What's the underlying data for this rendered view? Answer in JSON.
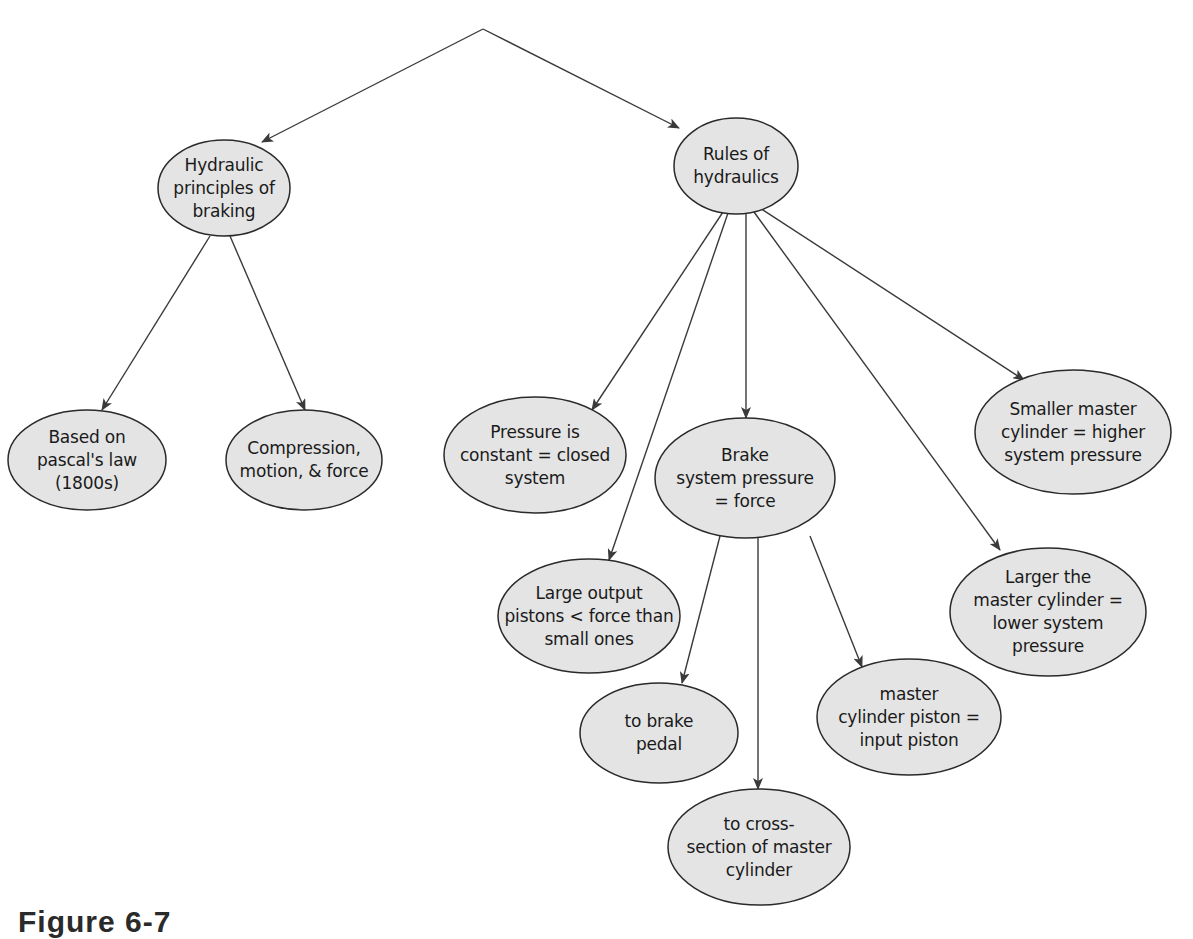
{
  "diagram": {
    "type": "concept-map",
    "colors": {
      "node_fill": "#e4e4e4",
      "node_stroke": "#2a2a2a",
      "edge": "#3a3a3a",
      "background": "#ffffff"
    },
    "root_apex": {
      "x": 483,
      "y": 29
    },
    "nodes": [
      {
        "id": "hydraulic-principles",
        "label": "Hydraulic\nprinciples of\nbraking",
        "cx": 224,
        "cy": 188,
        "rx": 66,
        "ry": 48
      },
      {
        "id": "rules-of-hydraulics",
        "label": "Rules of\nhydraulics",
        "cx": 736,
        "cy": 166,
        "rx": 62,
        "ry": 48
      },
      {
        "id": "pascals-law",
        "label": "Based on\npascal's law\n(1800s)",
        "cx": 87,
        "cy": 460,
        "rx": 79,
        "ry": 50
      },
      {
        "id": "compression-motion-force",
        "label": "Compression,\nmotion, & force",
        "cx": 304,
        "cy": 460,
        "rx": 78,
        "ry": 50
      },
      {
        "id": "pressure-constant",
        "label": "Pressure is\nconstant = closed\nsystem",
        "cx": 535,
        "cy": 455,
        "rx": 91,
        "ry": 58
      },
      {
        "id": "brake-system-pressure",
        "label": "Brake\nsystem pressure\n= force",
        "cx": 745,
        "cy": 478,
        "rx": 90,
        "ry": 60
      },
      {
        "id": "smaller-master-cylinder",
        "label": "Smaller master\ncylinder = higher\nsystem pressure",
        "cx": 1073,
        "cy": 432,
        "rx": 98,
        "ry": 62
      },
      {
        "id": "larger-master-cylinder",
        "label": "Larger the\nmaster cylinder =\nlower system\npressure",
        "cx": 1048,
        "cy": 612,
        "rx": 98,
        "ry": 64
      },
      {
        "id": "large-output-pistons",
        "label": "Large output\npistons < force than\nsmall ones",
        "cx": 589,
        "cy": 616,
        "rx": 91,
        "ry": 57
      },
      {
        "id": "to-brake-pedal",
        "label": "to brake\npedal",
        "cx": 659,
        "cy": 733,
        "rx": 79,
        "ry": 50
      },
      {
        "id": "master-cylinder-piston",
        "label": "master\ncylinder piston =\ninput piston",
        "cx": 909,
        "cy": 717,
        "rx": 92,
        "ry": 58
      },
      {
        "id": "cross-section",
        "label": "to cross-\nsection of master\ncylinder",
        "cx": 759,
        "cy": 847,
        "rx": 91,
        "ry": 58
      }
    ],
    "edges": [
      {
        "from": "root",
        "to": "hydraulic-principles",
        "x1": 483,
        "y1": 29,
        "x2": 262,
        "y2": 142
      },
      {
        "from": "root",
        "to": "rules-of-hydraulics",
        "x1": 483,
        "y1": 29,
        "x2": 679,
        "y2": 128
      },
      {
        "from": "hydraulic-principles",
        "to": "pascals-law",
        "x1": 210,
        "y1": 236,
        "x2": 102,
        "y2": 410
      },
      {
        "from": "hydraulic-principles",
        "to": "compression-motion-force",
        "x1": 230,
        "y1": 236,
        "x2": 305,
        "y2": 410
      },
      {
        "from": "rules-of-hydraulics",
        "to": "pressure-constant",
        "x1": 723,
        "y1": 212,
        "x2": 592,
        "y2": 410
      },
      {
        "from": "rules-of-hydraulics",
        "to": "large-output-pistons",
        "x1": 728,
        "y1": 213,
        "x2": 609,
        "y2": 560
      },
      {
        "from": "rules-of-hydraulics",
        "to": "brake-system-pressure",
        "x1": 746,
        "y1": 214,
        "x2": 746,
        "y2": 418
      },
      {
        "from": "rules-of-hydraulics",
        "to": "larger-master-cylinder",
        "x1": 754,
        "y1": 212,
        "x2": 1000,
        "y2": 550
      },
      {
        "from": "rules-of-hydraulics",
        "to": "smaller-master-cylinder",
        "x1": 760,
        "y1": 208,
        "x2": 1024,
        "y2": 380
      },
      {
        "from": "brake-system-pressure",
        "to": "to-brake-pedal",
        "x1": 720,
        "y1": 536,
        "x2": 682,
        "y2": 683
      },
      {
        "from": "brake-system-pressure",
        "to": "cross-section",
        "x1": 758,
        "y1": 538,
        "x2": 758,
        "y2": 789
      },
      {
        "from": "brake-system-pressure",
        "to": "master-cylinder-piston",
        "x1": 810,
        "y1": 536,
        "x2": 862,
        "y2": 667
      }
    ]
  },
  "caption": "Figure 6-7"
}
